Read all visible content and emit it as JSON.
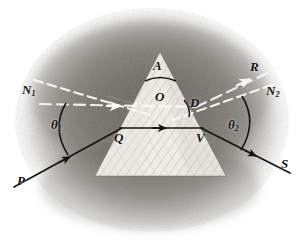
{
  "figure": {
    "kind": "optics-ray-diagram",
    "width": 303,
    "height": 249,
    "background_color": "#ffffff",
    "vignette_color": "#8e8a84",
    "prism_fill_color": "#f4f2ed",
    "ray_color": "#17140f",
    "dashed_line_color": "#ffffff",
    "label_color": "#15130f"
  },
  "labels": {
    "apex": "A",
    "interior_point": "O",
    "deviation": "D",
    "entry_point": "Q",
    "exit_point": "V",
    "incident_ray": "P",
    "emergent_ray": "S",
    "refracted_extension": "R",
    "normal_left": "N",
    "normal_left_sub": "1",
    "normal_right": "N",
    "normal_right_sub": "2",
    "angle_incidence": "θ",
    "angle_incidence_sub": "1",
    "angle_emergence": "θ",
    "angle_emergence_sub": "2"
  },
  "geometry": {
    "prism_apex": [
      160,
      52
    ],
    "prism_base_left": [
      95,
      176
    ],
    "prism_base_right": [
      226,
      176
    ],
    "entry_point": [
      121,
      128
    ],
    "exit_point": [
      202,
      128
    ],
    "incident_start": [
      14,
      187
    ],
    "emergent_end": [
      288,
      174
    ]
  },
  "annotations": [
    {
      "name": "apex-angle-arc",
      "about": "arc marking prism apex angle A"
    },
    {
      "name": "deviation-angle-arc",
      "about": "arc marking angle of deviation D"
    },
    {
      "name": "theta1-arc",
      "about": "arc between normal N1 and incident ray PQ"
    },
    {
      "name": "theta2-arc",
      "about": "arc between normal N2 and emergent ray VS"
    }
  ]
}
